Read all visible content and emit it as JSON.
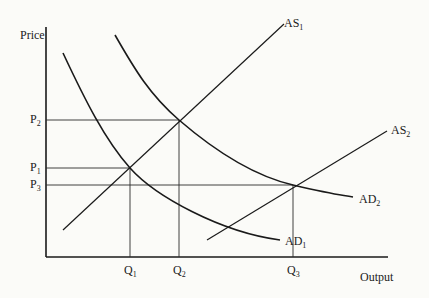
{
  "diagram": {
    "title": "",
    "y_axis_label": "Price",
    "x_axis_label": "Output",
    "price_levels": [
      {
        "name": "P",
        "sub": "2"
      },
      {
        "name": "P",
        "sub": "1"
      },
      {
        "name": "P",
        "sub": "3"
      }
    ],
    "quantity_levels": [
      {
        "name": "Q",
        "sub": "1"
      },
      {
        "name": "Q",
        "sub": "2"
      },
      {
        "name": "Q",
        "sub": "3"
      }
    ],
    "curves": {
      "as1": {
        "name": "AS",
        "sub": "1"
      },
      "as2": {
        "name": "AS",
        "sub": "2"
      },
      "ad1": {
        "name": "AD",
        "sub": "1"
      },
      "ad2": {
        "name": "AD",
        "sub": "2"
      }
    },
    "equilibria": [
      {
        "curves": "AD1 ∩ AS1",
        "price": "P1",
        "output": "Q1"
      },
      {
        "curves": "AD2 ∩ AS1",
        "price": "P2",
        "output": "Q2"
      },
      {
        "curves": "AD2 ∩ AS2",
        "price": "P3",
        "output": "Q3"
      }
    ],
    "colors": {
      "ink": "#1a1a1a",
      "paper": "#fbfbf8"
    }
  }
}
